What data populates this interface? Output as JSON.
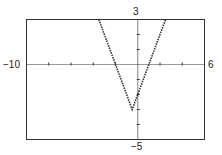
{
  "chart_data": {
    "type": "line",
    "title": "",
    "xlabel": "",
    "ylabel": "",
    "xlim": [
      -10,
      6
    ],
    "ylim": [
      -5,
      3
    ],
    "xscale": 1,
    "yscale": 1,
    "grid": false,
    "tick_labels": {
      "xmin": "−10",
      "xmax": "6",
      "ymin": "−5",
      "ymax": "3"
    },
    "series": [
      {
        "name": "y = 2|x + 0.5| − 3",
        "style": "dotted",
        "color": "#333333",
        "x": [
          -3.5,
          -2.0,
          -0.5,
          1.0,
          2.5
        ],
        "y": [
          3.0,
          0.0,
          -3.0,
          0.0,
          3.0
        ]
      }
    ],
    "vertex": {
      "x": -0.5,
      "y": -3.0
    }
  }
}
